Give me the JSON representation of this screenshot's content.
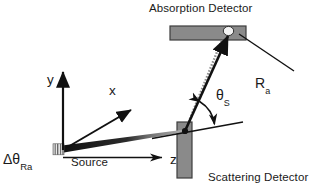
{
  "figure": {
    "type": "scientific-schematic",
    "background_color": "#ffffff",
    "stroke_color": "#1a1a1a",
    "detector_fill": "#8a8a8a",
    "detector_stroke": "#3a3a3a",
    "beam_color": "#111111",
    "beam_ghost_color": "#9a9a9a",
    "width": 317,
    "height": 193
  },
  "labels": {
    "absorption_detector": "Absorption Detector",
    "scattering_detector": "Scattering Detector",
    "source": "Source",
    "delta_theta_symbol": "Δθ",
    "delta_theta_subscript": "Ra",
    "axis_y": "y",
    "axis_x": "x",
    "axis_z": "z",
    "theta_s_symbol": "θ",
    "theta_s_subscript": "S",
    "ra_symbol": "R",
    "ra_subscript": "a"
  },
  "geometry": {
    "origin": {
      "x": 63,
      "y": 150
    },
    "source_point": {
      "x": 64,
      "y": 149
    },
    "scatter_point": {
      "x": 185,
      "y": 131
    },
    "absorption_point": {
      "x": 228,
      "y": 32
    },
    "y_axis_tip": {
      "x": 63,
      "y": 66
    },
    "x_axis_tip": {
      "x": 136,
      "y": 106
    },
    "z_axis_tip": {
      "x": 167,
      "y": 158
    },
    "absorption_bar": {
      "x": 170,
      "y": 26,
      "width": 76,
      "height": 14
    },
    "scattering_bar": {
      "x": 177,
      "y": 122,
      "width": 15,
      "height": 56
    },
    "source_hatch": {
      "x": 53,
      "y": 144,
      "width": 11,
      "height": 11
    },
    "sample_plane_left": {
      "x": 152,
      "y": 138
    },
    "sample_plane_right": {
      "x": 243,
      "y": 122
    },
    "ra_leader_start": {
      "x": 294,
      "y": 71
    },
    "ra_leader_end": {
      "x": 240,
      "y": 35
    },
    "theta_s_value_deg": 66
  }
}
